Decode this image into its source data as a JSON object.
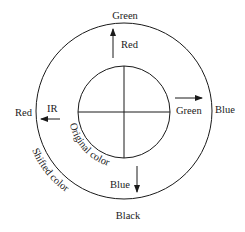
{
  "diagram": {
    "outer_ring": {
      "top": "Green",
      "right": "Blue",
      "bottom": "Black",
      "left": "Red",
      "arc_label": "Shifted color"
    },
    "inner_circle": {
      "top": "Red",
      "right": "Green",
      "bottom": "Blue",
      "left": "IR",
      "arc_label": "Original color"
    },
    "arrows": [
      {
        "direction": "up",
        "from": "Red",
        "to": "Green"
      },
      {
        "direction": "right",
        "from": "Green",
        "to": "Blue"
      },
      {
        "direction": "down",
        "from": "Blue",
        "to": "Black"
      },
      {
        "direction": "left",
        "from": "IR",
        "to": "Red"
      }
    ]
  }
}
